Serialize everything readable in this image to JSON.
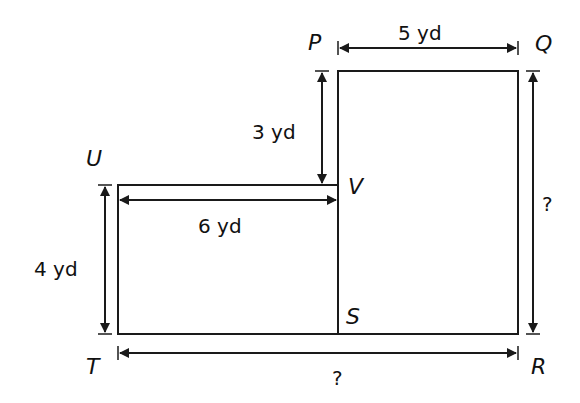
{
  "diagram": {
    "type": "composite-rectangle",
    "stroke_color": "#1a1a1a",
    "points": {
      "P": "P",
      "Q": "Q",
      "R": "R",
      "S": "S",
      "T": "T",
      "U": "U",
      "V": "V"
    },
    "dimensions": {
      "pq": "5 yd",
      "pv": "3 yd",
      "uv": "6 yd",
      "ut": "4 yd",
      "qr": "?",
      "tr": "?"
    }
  }
}
